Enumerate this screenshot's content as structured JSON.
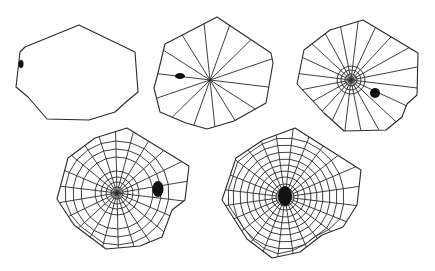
{
  "diagram": {
    "type": "spider-web-construction-stages",
    "colors": {
      "background": "#ffffff",
      "line": "#2a2a2a",
      "spider": "#111111"
    },
    "stages": [
      {
        "id": "stage-1-frame",
        "frame": [
          [
            79,
            25
          ],
          [
            135,
            52
          ],
          [
            138,
            92
          ],
          [
            126,
            102
          ],
          [
            115,
            112
          ],
          [
            89,
            120
          ],
          [
            47,
            119
          ],
          [
            28,
            97
          ],
          [
            16,
            87
          ],
          [
            20,
            52
          ],
          [
            25,
            47
          ]
        ],
        "hub": [
          79,
          72
        ],
        "radii": 0,
        "hub_rings": [],
        "spiral_rings": [],
        "spider": {
          "x": 21,
          "y": 64,
          "rx": 2.5,
          "ry": 4
        }
      },
      {
        "id": "stage-2-radii",
        "frame": [
          [
            217,
            17
          ],
          [
            271,
            53
          ],
          [
            273,
            63
          ],
          [
            266,
            103
          ],
          [
            234,
            121
          ],
          [
            207,
            129
          ],
          [
            186,
            123
          ],
          [
            160,
            112
          ],
          [
            154,
            88
          ],
          [
            158,
            73
          ],
          [
            165,
            44
          ]
        ],
        "hub": [
          210,
          80
        ],
        "radii": 14,
        "hub_rings": [],
        "spiral_rings": [],
        "spider": {
          "x": 180,
          "y": 76,
          "rx": 5,
          "ry": 3
        }
      },
      {
        "id": "stage-3-auxiliary-spiral",
        "frame": [
          [
            363,
            20
          ],
          [
            418,
            53
          ],
          [
            417,
            95
          ],
          [
            407,
            104
          ],
          [
            402,
            117
          ],
          [
            386,
            130
          ],
          [
            344,
            131
          ],
          [
            324,
            113
          ],
          [
            297,
            84
          ],
          [
            304,
            50
          ],
          [
            330,
            30
          ]
        ],
        "hub": [
          351,
          80
        ],
        "radii": 20,
        "hub_rings": [
          6,
          10,
          14
        ],
        "spiral_rings": [],
        "spider": {
          "x": 375,
          "y": 93,
          "rx": 5,
          "ry": 5
        }
      },
      {
        "id": "stage-4-capture-spiral-begin",
        "frame": [
          [
            127,
            128
          ],
          [
            189,
            166
          ],
          [
            185,
            200
          ],
          [
            172,
            210
          ],
          [
            162,
            237
          ],
          [
            140,
            246
          ],
          [
            106,
            249
          ],
          [
            74,
            225
          ],
          [
            57,
            199
          ],
          [
            68,
            158
          ],
          [
            95,
            138
          ]
        ],
        "hub": [
          117,
          193
        ],
        "radii": 22,
        "hub_rings": [
          6,
          11,
          16,
          22
        ],
        "spiral_rings": [
          36,
          44,
          52
        ],
        "spider": {
          "x": 158,
          "y": 189,
          "rx": 5.5,
          "ry": 8
        }
      },
      {
        "id": "stage-5-capture-spiral-complete",
        "frame": [
          [
            295,
            128
          ],
          [
            361,
            170
          ],
          [
            357,
            205
          ],
          [
            343,
            227
          ],
          [
            322,
            235
          ],
          [
            300,
            252
          ],
          [
            272,
            258
          ],
          [
            247,
            239
          ],
          [
            222,
            200
          ],
          [
            236,
            158
          ],
          [
            263,
            140
          ]
        ],
        "hub": [
          285,
          197
        ],
        "radii": 24,
        "hub_rings": [
          5,
          9,
          13
        ],
        "spiral_rings": [
          20,
          26,
          32,
          38,
          45,
          52,
          59
        ],
        "spider": {
          "x": 285,
          "y": 196,
          "rx": 7,
          "ry": 10
        }
      }
    ]
  }
}
